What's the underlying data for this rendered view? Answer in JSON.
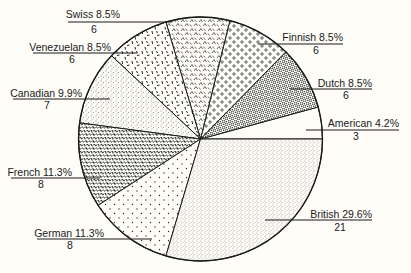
{
  "chart_data": {
    "type": "pie",
    "title": "",
    "total": 71,
    "start_angle_deg": 0,
    "direction": "counterclockwise",
    "slices": [
      {
        "label": "American",
        "percent": "4.2%",
        "count": 3,
        "pattern": "blank"
      },
      {
        "label": "Dutch",
        "percent": "8.5%",
        "count": 6,
        "pattern": "dense-cells"
      },
      {
        "label": "Finnish",
        "percent": "8.5%",
        "count": 6,
        "pattern": "circles"
      },
      {
        "label": "Swiss",
        "percent": "8.5%",
        "count": 6,
        "pattern": "chevrons"
      },
      {
        "label": "Venezuelan",
        "percent": "8.5%",
        "count": 6,
        "pattern": "dashes"
      },
      {
        "label": "Canadian",
        "percent": "9.9%",
        "count": 7,
        "pattern": "fine-stipple"
      },
      {
        "label": "French",
        "percent": "11.3%",
        "count": 8,
        "pattern": "dense-squiggles"
      },
      {
        "label": "German",
        "percent": "11.3%",
        "count": 8,
        "pattern": "sparse-dots"
      },
      {
        "label": "British",
        "percent": "29.6%",
        "count": 21,
        "pattern": "stipple"
      }
    ],
    "categories": [
      "American",
      "Dutch",
      "Finnish",
      "Swiss",
      "Venezuelan",
      "Canadian",
      "French",
      "German",
      "British"
    ],
    "values": [
      3,
      6,
      6,
      6,
      6,
      7,
      8,
      8,
      21
    ],
    "percentages": [
      4.2,
      8.5,
      8.5,
      8.5,
      8.5,
      9.9,
      11.3,
      11.3,
      29.6
    ],
    "legend": "none (direct leader-line labels)"
  },
  "labels": [
    {
      "name": "American",
      "text": "American 4.2%",
      "count": "3",
      "tx": 399,
      "ty": 127,
      "lx1": 306,
      "lx2": 399,
      "ly": 130,
      "cx": 356,
      "cy": 140
    },
    {
      "name": "Dutch",
      "text": "Dutch 8.5%",
      "count": "6",
      "tx": 372,
      "ty": 87,
      "lx1": 290,
      "lx2": 372,
      "ly": 89,
      "cx": 346,
      "cy": 99
    },
    {
      "name": "Finnish",
      "text": "Finnish 8.5%",
      "count": "6",
      "tx": 343,
      "ty": 41,
      "lx1": 258,
      "lx2": 343,
      "ly": 44,
      "cx": 316,
      "cy": 54
    },
    {
      "name": "Swiss",
      "text": "Swiss 8.5%",
      "count": "6",
      "tx": 120,
      "ty": 18,
      "lx1": 68,
      "lx2": 172,
      "ly": 22,
      "cx": 94,
      "cy": 33
    },
    {
      "name": "Venezuelan",
      "text": "Venezuelan 8.5%",
      "count": "6",
      "tx": 111,
      "ty": 51,
      "lx1": 33,
      "lx2": 137,
      "ly": 53,
      "cx": 72,
      "cy": 63
    },
    {
      "name": "Canadian",
      "text": "Canadian 9.9%",
      "count": "7",
      "tx": 82,
      "ty": 97,
      "lx1": 13,
      "lx2": 110,
      "ly": 99,
      "cx": 47,
      "cy": 109
    },
    {
      "name": "French",
      "text": "French 11.3%",
      "count": "8",
      "tx": 72,
      "ty": 176,
      "lx1": 11,
      "lx2": 100,
      "ly": 178,
      "cx": 41,
      "cy": 188
    },
    {
      "name": "German",
      "text": "German 11.3%",
      "count": "8",
      "tx": 104,
      "ty": 237,
      "lx1": 37,
      "lx2": 152,
      "ly": 239,
      "cx": 70,
      "cy": 249
    },
    {
      "name": "British",
      "text": "British 29.6%",
      "count": "21",
      "tx": 372,
      "ty": 218,
      "lx1": 265,
      "lx2": 372,
      "ly": 220,
      "cx": 340,
      "cy": 231
    }
  ],
  "geometry": {
    "cx": 200.5,
    "cy": 139,
    "r": 122
  },
  "colors": {
    "background": "#fefdf8",
    "ink": "#1a1a1a"
  }
}
